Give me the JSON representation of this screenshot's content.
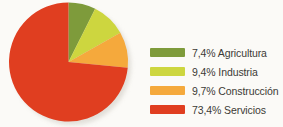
{
  "chart_data": {
    "type": "pie",
    "title": "",
    "labels": [
      "Agricultura",
      "Industria",
      "Construcción",
      "Servicios"
    ],
    "values": [
      7.4,
      9.4,
      9.7,
      73.4
    ],
    "value_suffix": "%",
    "colors": [
      "#7e9b3b",
      "#cdd63f",
      "#f5a93c",
      "#e03e20"
    ],
    "legend_position": "right",
    "start_angle_deg": 0,
    "direction": "clockwise",
    "grid": false,
    "background": "#fbfaf7",
    "legend": [
      {
        "label": "Agricultura",
        "value": "7,4%",
        "text": "7,4% Agricultura",
        "color": "#7e9b3b"
      },
      {
        "label": "Industria",
        "value": "9,4%",
        "text": "9,4% Industria",
        "color": "#cdd63f"
      },
      {
        "label": "Construcción",
        "value": "9,7%",
        "text": "9,7% Construcción",
        "color": "#f5a93c"
      },
      {
        "label": "Servicios",
        "value": "73,4%",
        "text": "73,4% Servicios",
        "color": "#e03e20"
      }
    ]
  }
}
